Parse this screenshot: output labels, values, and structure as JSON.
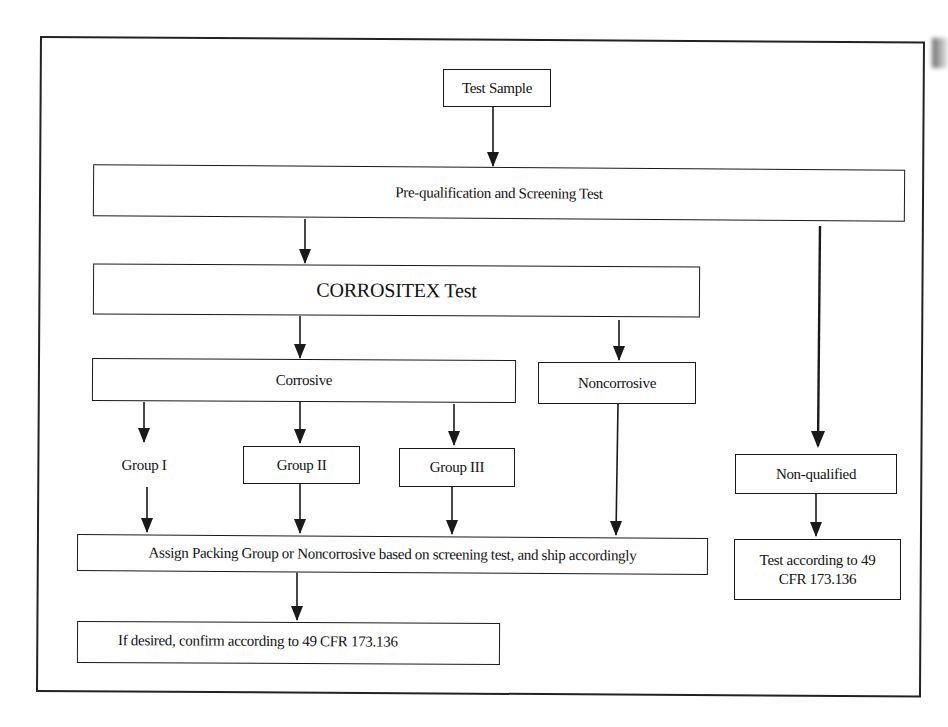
{
  "diagram": {
    "nodes": {
      "test_sample": "Test Sample",
      "prequal": "Pre-qualification and Screening Test",
      "corrositex": "CORROSITEX Test",
      "corrosive": "Corrosive",
      "noncorrosive": "Noncorrosive",
      "group1": "Group I",
      "group2": "Group II",
      "group3": "Group III",
      "nonqualified": "Non-qualified",
      "assign": "Assign Packing Group or Noncorrosive based on screening test, and ship accordingly",
      "confirm": "If desired, confirm according to 49 CFR 173.136",
      "test_cfr": "Test according to 49 CFR 173.136"
    },
    "edges": [
      {
        "from": "Test Sample",
        "to": "Pre-qualification and Screening Test"
      },
      {
        "from": "Pre-qualification and Screening Test",
        "to": "CORROSITEX Test"
      },
      {
        "from": "Pre-qualification and Screening Test",
        "to": "Non-qualified"
      },
      {
        "from": "CORROSITEX Test",
        "to": "Corrosive"
      },
      {
        "from": "CORROSITEX Test",
        "to": "Noncorrosive"
      },
      {
        "from": "Corrosive",
        "to": "Group I"
      },
      {
        "from": "Corrosive",
        "to": "Group II"
      },
      {
        "from": "Corrosive",
        "to": "Group III"
      },
      {
        "from": "Group I",
        "to": "Assign Packing Group or Noncorrosive based on screening test, and ship accordingly"
      },
      {
        "from": "Group II",
        "to": "Assign Packing Group or Noncorrosive based on screening test, and ship accordingly"
      },
      {
        "from": "Group III",
        "to": "Assign Packing Group or Noncorrosive based on screening test, and ship accordingly"
      },
      {
        "from": "Noncorrosive",
        "to": "Assign Packing Group or Noncorrosive based on screening test, and ship accordingly"
      },
      {
        "from": "Assign Packing Group or Noncorrosive based on screening test, and ship accordingly",
        "to": "If desired, confirm according to 49 CFR 173.136"
      },
      {
        "from": "Non-qualified",
        "to": "Test according to 49 CFR 173.136"
      }
    ],
    "colors": {
      "line": "#1a1a1a",
      "background": "#ffffff"
    }
  }
}
